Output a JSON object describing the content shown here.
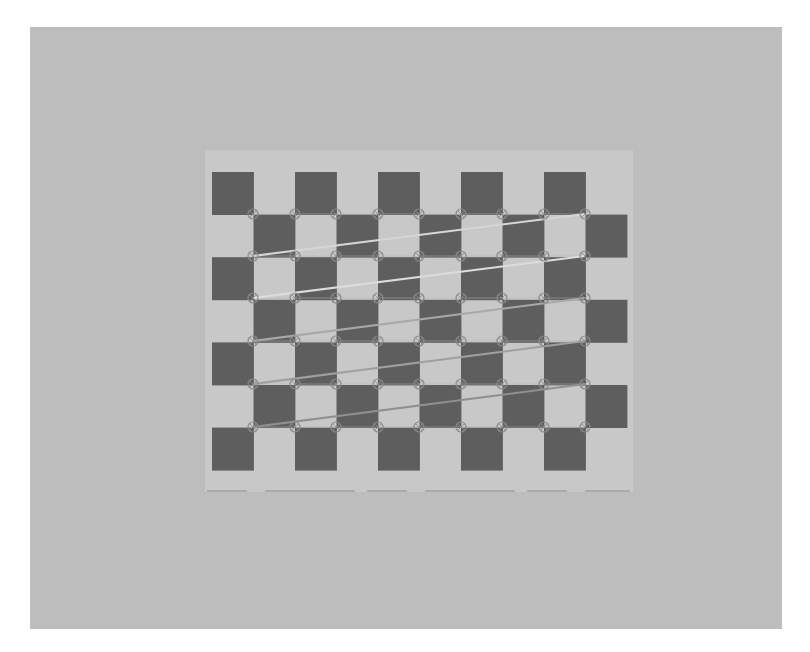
{
  "image": {
    "caption": "Checkerboard calibration target with detected inner corners",
    "width": 810,
    "height": 652
  },
  "colors": {
    "frame": "#ffffff",
    "background": "#bdbdbd",
    "paper": "#c8c8c8",
    "dark_square": "#5e5e5e",
    "corner_marker": "#8a8a8a",
    "bottom_edge_line": "#8c8c8c"
  },
  "background_field": {
    "x": 30,
    "y": 27,
    "width": 752,
    "height": 602
  },
  "paper": {
    "x": 205,
    "y": 150,
    "width": 428,
    "height": 342
  },
  "bottom_edge_line": {
    "x1": 207,
    "y1": 491,
    "x2": 630,
    "y2": 491
  },
  "checkerboard": {
    "origin_x": 212,
    "origin_y": 172,
    "columns": 10,
    "rows": 7,
    "cell_width": 41.5,
    "cell_height": 42.6,
    "dark_when_row_plus_col_even": true
  },
  "corners": {
    "pattern_size": [
      9,
      6
    ],
    "found": true,
    "marker_radius": 5,
    "x": [
      253,
      295,
      336,
      378,
      419,
      461,
      502,
      544,
      585
    ],
    "y": [
      214,
      256,
      298,
      341,
      384,
      427
    ]
  },
  "connector_lines": [
    {
      "from": [
        585,
        214
      ],
      "to": [
        253,
        256
      ],
      "color": "#d6d6d6",
      "width": 2
    },
    {
      "from": [
        585,
        256
      ],
      "to": [
        253,
        298
      ],
      "color": "#dcdcdc",
      "width": 2
    },
    {
      "from": [
        585,
        298
      ],
      "to": [
        253,
        341
      ],
      "color": "#a8a8a8",
      "width": 2
    },
    {
      "from": [
        585,
        341
      ],
      "to": [
        253,
        384
      ],
      "color": "#a0a0a0",
      "width": 2
    },
    {
      "from": [
        585,
        384
      ],
      "to": [
        253,
        427
      ],
      "color": "#8f8f8f",
      "width": 2
    }
  ]
}
